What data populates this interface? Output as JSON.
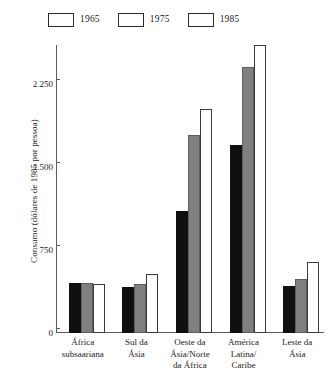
{
  "chart_data": {
    "type": "bar",
    "title": "",
    "subtitle": "",
    "xlabel": "",
    "ylabel": "Consumo (dólares de 1985 por pessoa)",
    "categories": [
      "África subsaariana",
      "Sul da Ásia",
      "Oeste da Ásia/Norte da África",
      "América Latina/Caribe",
      "Leste da Ásia"
    ],
    "category_lines": [
      [
        "África",
        "subsaariana"
      ],
      [
        "Sul da",
        "Ásia"
      ],
      [
        "Oeste da",
        "Ásia/Norte",
        "da África"
      ],
      [
        "América",
        "Latina/",
        "Caribe"
      ],
      [
        "Leste da",
        "Ásia"
      ]
    ],
    "series": [
      {
        "name": "1965",
        "color": "#101010",
        "values": [
          450,
          415,
          1105,
          1700,
          420
        ]
      },
      {
        "name": "1975",
        "color": "#808080",
        "values": [
          450,
          445,
          1790,
          2400,
          490
        ]
      },
      {
        "name": "1985",
        "color": "#ffffff",
        "values": [
          440,
          530,
          2020,
          2600,
          640
        ]
      }
    ],
    "ylim": [
      0,
      2600
    ],
    "yticks": [
      0,
      750,
      1500,
      2250
    ],
    "ytick_labels": [
      "0",
      "750",
      "1.500",
      "2.250"
    ],
    "grid": false,
    "legend_position": "top-left",
    "axis_color": "#5a5a5a"
  },
  "legend": {
    "entries": [
      {
        "label": "1965"
      },
      {
        "label": "1975"
      },
      {
        "label": "1985"
      }
    ]
  }
}
